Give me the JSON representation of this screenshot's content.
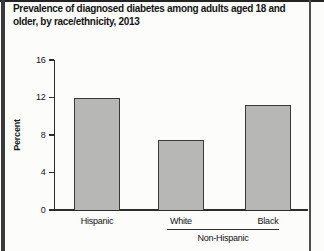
{
  "figure": {
    "title_lines": [
      "Prevalence of diagnosed diabetes among adults aged 18 and",
      "older, by race/ethnicity, 2013"
    ]
  },
  "chart_data": {
    "type": "bar",
    "title": "Prevalence of diagnosed diabetes among adults aged 18 and older, by race/ethnicity, 2013",
    "categories": [
      "Hispanic",
      "White",
      "Black"
    ],
    "values": [
      12.0,
      7.5,
      11.2
    ],
    "xlabel": "",
    "ylabel": "Percent",
    "ylim": [
      0,
      16
    ],
    "yticks": [
      0,
      4,
      8,
      12,
      16
    ],
    "grid": false,
    "legend": "none",
    "bar_color": "#b7b7b5",
    "bar_border_color": "#3a3a3a",
    "group_label": "Non-Hispanic",
    "group_span_categories": [
      "White",
      "Black"
    ]
  }
}
